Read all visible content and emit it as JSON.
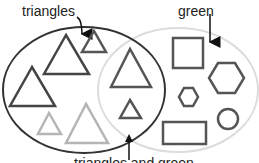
{
  "diagram": {
    "type": "venn",
    "labels": {
      "left_set": "triangles",
      "right_set": "green",
      "intersection": "triangles and green"
    },
    "colors": {
      "left_ellipse": "#333333",
      "right_ellipse": "#d8d8d8",
      "green_shape_stroke": "#555555",
      "non_green_shape_stroke": "#b0b0b0",
      "dark_triangle_stroke": "#333333"
    },
    "regions": {
      "left_only": [
        "large triangle",
        "small triangle",
        "medium triangle",
        "light small triangle",
        "light large triangle"
      ],
      "intersection": [
        "large triangle",
        "small triangle"
      ],
      "right_only": [
        "square",
        "large hexagon",
        "small hexagon",
        "rectangle",
        "circle"
      ]
    }
  }
}
